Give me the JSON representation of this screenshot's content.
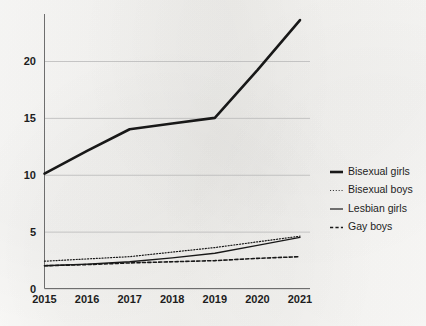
{
  "chart_data": {
    "type": "line",
    "title": "",
    "subtitle": "",
    "xlabel": "",
    "ylabel": "",
    "x": [
      2015,
      2016,
      2017,
      2018,
      2019,
      2020,
      2021
    ],
    "xtick_labels": [
      "2015",
      "2016",
      "2017",
      "2018",
      "2019",
      "2020",
      "2021"
    ],
    "ytick_labels": [
      "0",
      "5",
      "10",
      "15",
      "20"
    ],
    "ytick_values": [
      0,
      5,
      10,
      15,
      20
    ],
    "xlim": [
      2015,
      2021
    ],
    "ylim": [
      0,
      23.8
    ],
    "grid": "horizontal",
    "legend_position": "right",
    "series": [
      {
        "name": "Bisexual girls",
        "style": "solid-thick",
        "color": "#181818",
        "width": 2.6,
        "values": [
          10.1,
          12.1,
          14.0,
          14.5,
          15.0,
          19.2,
          23.6
        ]
      },
      {
        "name": "Bisexual boys",
        "style": "dotted",
        "color": "#3a3a3a",
        "width": 1.2,
        "values": [
          2.4,
          2.6,
          2.8,
          3.2,
          3.6,
          4.1,
          4.6
        ]
      },
      {
        "name": "Lesbian girls",
        "style": "solid-thin",
        "color": "#2a2a2a",
        "width": 1.3,
        "values": [
          2.0,
          2.15,
          2.35,
          2.7,
          3.1,
          3.8,
          4.5
        ]
      },
      {
        "name": "Gay boys",
        "style": "dashed",
        "color": "#181818",
        "width": 1.6,
        "values": [
          2.0,
          2.1,
          2.25,
          2.35,
          2.45,
          2.65,
          2.8
        ]
      }
    ]
  },
  "legend": {
    "items": [
      {
        "label": "Bisexual girls",
        "swatch": "solid-thick"
      },
      {
        "label": "Bisexual boys",
        "swatch": "dotted"
      },
      {
        "label": "Lesbian girls",
        "swatch": "solid-thin"
      },
      {
        "label": "Gay boys",
        "swatch": "dashed"
      }
    ]
  },
  "axes": {
    "y_labels": [
      "20",
      "15",
      "10",
      "5",
      "0"
    ],
    "x_labels": [
      "2015",
      "2016",
      "2017",
      "2018",
      "2019",
      "2020",
      "2021"
    ]
  }
}
